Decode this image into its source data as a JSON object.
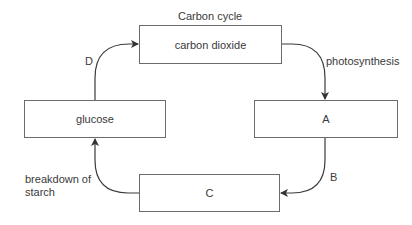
{
  "diagram": {
    "title": "Carbon cycle",
    "nodes": {
      "carbon_dioxide": "carbon dioxide",
      "glucose": "glucose",
      "a": "A",
      "c": "C"
    },
    "edges": {
      "photosynthesis": {
        "from": "carbon dioxide",
        "to": "A",
        "label": "photosynthesis"
      },
      "b": {
        "from": "A",
        "to": "C",
        "label": "B"
      },
      "breakdown": {
        "from": "C",
        "to": "glucose",
        "label": "breakdown of starch",
        "line1": "breakdown of",
        "line2": "starch"
      },
      "d": {
        "from": "glucose",
        "to": "carbon dioxide",
        "label": "D"
      }
    },
    "colors": {
      "line": "#3a3a3a",
      "box_border": "#6b6b6b",
      "text": "#3a3a3a",
      "background": "#ffffff"
    }
  }
}
